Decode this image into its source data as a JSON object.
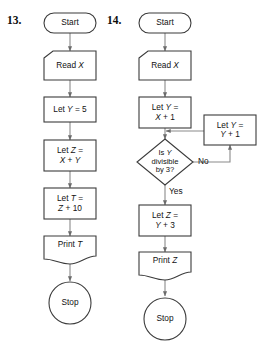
{
  "page": {
    "background_color": "#ffffff",
    "stroke_color": "#3b3b3b",
    "text_color": "#111111",
    "fill_color": "#ffffff"
  },
  "problems": [
    {
      "number": "13.",
      "nodes": [
        {
          "id": "start",
          "shape": "terminal",
          "text": "Start"
        },
        {
          "id": "read",
          "shape": "input",
          "text": "Read X",
          "text_parts": [
            "Read ",
            "X"
          ]
        },
        {
          "id": "let_y",
          "shape": "process",
          "lines": [
            "Let Y = 5"
          ]
        },
        {
          "id": "let_z",
          "shape": "process",
          "lines": [
            "Let Z =",
            "X + Y"
          ]
        },
        {
          "id": "let_t",
          "shape": "process",
          "lines": [
            "Let T =",
            "Z + 10"
          ]
        },
        {
          "id": "print",
          "shape": "document",
          "text": "Print T"
        },
        {
          "id": "stop",
          "shape": "terminal-circle",
          "text": "Stop"
        }
      ],
      "edge_labels": []
    },
    {
      "number": "14.",
      "nodes": [
        {
          "id": "start",
          "shape": "terminal",
          "text": "Start"
        },
        {
          "id": "read",
          "shape": "input",
          "text": "Read X",
          "text_parts": [
            "Read ",
            "X"
          ]
        },
        {
          "id": "let_y",
          "shape": "process",
          "lines": [
            "Let Y =",
            "X + 1"
          ]
        },
        {
          "id": "decision",
          "shape": "decision",
          "lines": [
            "Is Y",
            "divisible",
            "by 3?"
          ]
        },
        {
          "id": "increment",
          "shape": "process",
          "lines": [
            "Let Y =",
            "Y + 1"
          ]
        },
        {
          "id": "let_z",
          "shape": "process",
          "lines": [
            "Let Z =",
            "Y + 3"
          ]
        },
        {
          "id": "print",
          "shape": "document",
          "text": "Print Z"
        },
        {
          "id": "stop",
          "shape": "terminal-circle",
          "text": "Stop"
        }
      ],
      "edge_labels": [
        {
          "id": "no",
          "text": "No"
        },
        {
          "id": "yes",
          "text": "Yes"
        }
      ]
    }
  ],
  "text": {
    "q13": {
      "number": "13.",
      "start": "Start",
      "read_prefix": "Read ",
      "read_var": "X",
      "let_y": "Let Y = 5",
      "let_y_pre": "Let ",
      "let_y_var": "Y",
      "let_y_post": " = 5",
      "let_z_l1_pre": "Let ",
      "let_z_l1_var": "Z",
      "let_z_l1_post": " =",
      "let_z_l2_a": "X",
      "let_z_l2_op": " + ",
      "let_z_l2_b": "Y",
      "let_t_l1_pre": "Let ",
      "let_t_l1_var": "T",
      "let_t_l1_post": " =",
      "let_t_l2_a": "Z",
      "let_t_l2_post": " + 10",
      "print_prefix": "Print ",
      "print_var": "T",
      "stop": "Stop"
    },
    "q14": {
      "number": "14.",
      "start": "Start",
      "read_prefix": "Read ",
      "read_var": "X",
      "let_y_l1_pre": "Let ",
      "let_y_l1_var": "Y",
      "let_y_l1_post": " =",
      "let_y_l2_a": "X",
      "let_y_l2_post": " + 1",
      "dec_l1_pre": "Is ",
      "dec_l1_var": "Y",
      "dec_l2": "divisible",
      "dec_l3": "by 3?",
      "inc_l1_pre": "Let ",
      "inc_l1_var": "Y",
      "inc_l1_post": " =",
      "inc_l2_a": "Y",
      "inc_l2_post": " + 1",
      "let_z_l1_pre": "Let ",
      "let_z_l1_var": "Z",
      "let_z_l1_post": " =",
      "let_z_l2_a": "Y",
      "let_z_l2_post": " + 3",
      "print_prefix": "Print ",
      "print_var": "Z",
      "stop": "Stop",
      "label_no": "No",
      "label_yes": "Yes"
    }
  }
}
